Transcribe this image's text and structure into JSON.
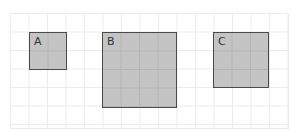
{
  "figure": {
    "grid": {
      "columns": 15,
      "rows": 6
    },
    "squares": [
      {
        "label": "A",
        "side_units": 2,
        "area_units": 4
      },
      {
        "label": "B",
        "side_units": 4,
        "area_units": 16
      },
      {
        "label": "C",
        "side_units": 3,
        "area_units": 9
      }
    ],
    "colors": {
      "fill": "#c4c4c4",
      "border": "#4a4a4a",
      "grid": "#ebebeb"
    }
  }
}
